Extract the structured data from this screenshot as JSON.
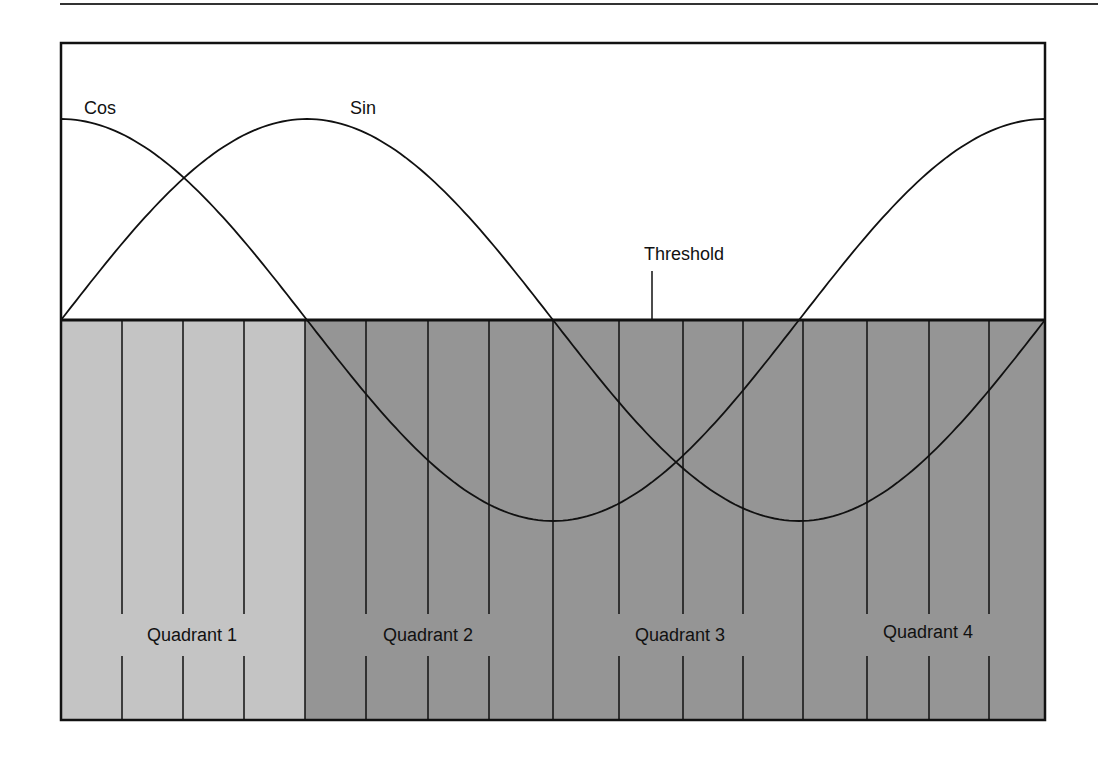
{
  "diagram": {
    "title": "",
    "labels": {
      "cos": "Cos",
      "sin": "Sin",
      "threshold": "Threshold"
    },
    "quadrants": [
      {
        "label": "Quadrant 1",
        "fill": "#c4c4c4"
      },
      {
        "label": "Quadrant 2",
        "fill": "#959595"
      },
      {
        "label": "Quadrant 3",
        "fill": "#959595"
      },
      {
        "label": "Quadrant 4",
        "fill": "#959595"
      }
    ],
    "colors": {
      "background": "#ffffff",
      "stroke": "#111111",
      "quadrant_light": "#c4c4c4",
      "quadrant_dark": "#959595"
    },
    "curves": [
      {
        "name": "Cos",
        "function": "cos(x)",
        "domain": "0 to 2π"
      },
      {
        "name": "Sin",
        "function": "sin(x)",
        "domain": "0 to 2π"
      }
    ],
    "subdivisions_per_quadrant": 4
  }
}
